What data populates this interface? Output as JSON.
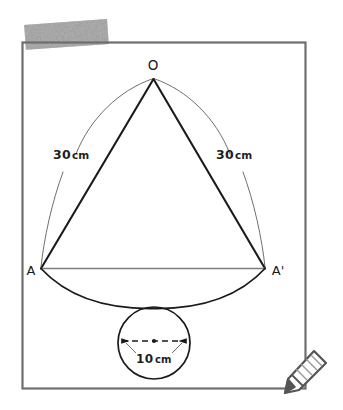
{
  "page": {
    "background_color": "#ffffff",
    "width": 343,
    "height": 410
  },
  "frame": {
    "name": "diagram-border-frame",
    "stroke_color": "#6e6e6e",
    "x": 22,
    "y": 42,
    "width": 284,
    "height": 347
  },
  "highlight": {
    "label": "marker-highlight-stroke",
    "color": "#9a9a9a",
    "rotation_deg": -4
  },
  "diagram": {
    "line_color": "#1a1a1a",
    "thin_line_color": "#585858",
    "chord_color": "#7d7d7d",
    "vertices": {
      "apex_label": "O",
      "left_label": "A",
      "right_label": "A'"
    },
    "measurements": {
      "slant_left_value": "30",
      "slant_left_unit": "cm",
      "slant_right_value": "30",
      "slant_right_unit": "cm",
      "diameter_value": "10",
      "diameter_unit": "cm"
    },
    "circle": {
      "name": "base-circle",
      "center_dot": true,
      "diameter_line_style": "dashed-double-arrow"
    }
  },
  "tools": {
    "edit_icon_name": "pencil-icon",
    "edit_icon_color": "#555555"
  }
}
